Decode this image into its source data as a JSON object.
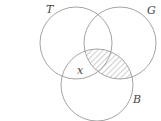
{
  "diagram": {
    "type": "venn",
    "sets": [
      {
        "id": "T",
        "label": "T",
        "cx": 76,
        "cy": 43,
        "r": 36
      },
      {
        "id": "G",
        "label": "G",
        "cx": 120,
        "cy": 43,
        "r": 36
      },
      {
        "id": "B",
        "label": "B",
        "cx": 97,
        "cy": 85,
        "r": 36
      }
    ],
    "region_label": "x",
    "region_label_location": "T ∩ B only (not G)",
    "shaded_region": "G ∩ B",
    "colors": {
      "stroke": "#9a9a9a",
      "hatch": "#9a9a9a",
      "text": "#444444"
    }
  }
}
